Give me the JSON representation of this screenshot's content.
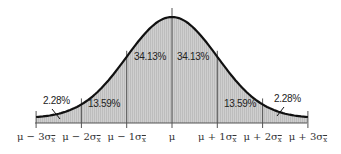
{
  "chart_data": {
    "type": "area",
    "title": "",
    "xlabel": "",
    "ylabel": "",
    "grid": false,
    "legend": "none",
    "categories": [
      "μ − 3σx̄",
      "μ − 2σx̄",
      "μ − 1σx̄",
      "μ",
      "μ + 1σx̄",
      "μ + 2σx̄",
      "μ + 3σx̄"
    ],
    "x": [
      -3,
      -2,
      -1,
      0,
      1,
      2,
      3
    ],
    "regions": [
      {
        "from": -3,
        "to": -2,
        "percent": "2.28%"
      },
      {
        "from": -2,
        "to": -1,
        "percent": "13.59%"
      },
      {
        "from": -1,
        "to": 0,
        "percent": "34.13%"
      },
      {
        "from": 0,
        "to": 1,
        "percent": "34.13%"
      },
      {
        "from": 1,
        "to": 2,
        "percent": "13.59%"
      },
      {
        "from": 2,
        "to": 3,
        "percent": "2.28%"
      }
    ],
    "colors": {
      "fill": "#c8c8c8",
      "curve": "#111111",
      "lines": "#555555"
    }
  },
  "labels": {
    "pct_left_tail": "2.28%",
    "pct_left_mid": "13.59%",
    "pct_left_center": "34.13%",
    "pct_right_center": "34.13%",
    "pct_right_mid": "13.59%",
    "pct_right_tail": "2.28%"
  },
  "ticks": [
    {
      "main": "μ − 3σ",
      "sub": "x"
    },
    {
      "main": "μ − 2σ",
      "sub": "x"
    },
    {
      "main": "μ − 1σ",
      "sub": "x"
    },
    {
      "main": "μ",
      "sub": ""
    },
    {
      "main": "μ + 1σ",
      "sub": "x"
    },
    {
      "main": "μ + 2σ",
      "sub": "x"
    },
    {
      "main": "μ + 3σ",
      "sub": "x"
    }
  ]
}
